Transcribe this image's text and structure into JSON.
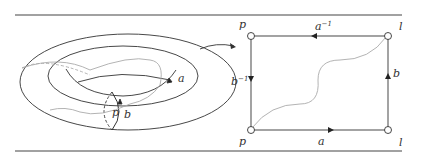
{
  "figure": {
    "torus": {
      "labels": {
        "point": "p",
        "loop_a": "a",
        "loop_b": "b"
      }
    },
    "square": {
      "corners": {
        "top_left": "p",
        "top_right": "l",
        "bottom_left": "p",
        "bottom_right": "l"
      },
      "edges": {
        "top": {
          "base": "a",
          "exp": "−1"
        },
        "left": {
          "base": "b",
          "exp": "−1"
        },
        "right": {
          "base": "b",
          "exp": ""
        },
        "bottom": {
          "base": "a",
          "exp": ""
        }
      }
    },
    "colors": {
      "line": "#333333",
      "curve": "#aaaaaa",
      "rule": "#444444"
    }
  }
}
